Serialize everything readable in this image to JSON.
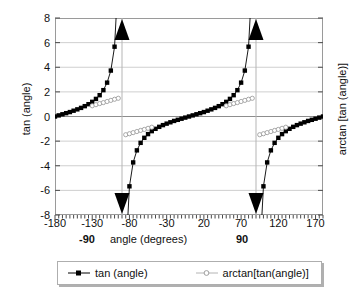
{
  "chart_data": {
    "type": "line",
    "title": "",
    "xlabel": "angle (degrees)",
    "ylabel": "tan (angle)",
    "ylabel_right": "arctan [tan (angle)]",
    "xlim": [
      -180,
      180
    ],
    "ylim": [
      -8,
      8
    ],
    "xticks": [
      -180,
      -130,
      -80,
      -30,
      20,
      70,
      120,
      170
    ],
    "yticks": [
      8,
      6,
      4,
      2,
      0,
      -2,
      -4,
      -6,
      -8
    ],
    "xtick_labels": [
      "-180",
      "-130",
      "-80",
      "-30",
      "20",
      "70",
      "120",
      "170"
    ],
    "ytick_labels": [
      "8",
      "6",
      "4",
      "2",
      "0",
      "-2",
      "-4",
      "-6",
      "-8"
    ],
    "xminor_step": 5,
    "grid": "horizontal-major-plus-asymptote-verticals",
    "legend_position": "below-plot",
    "asymptotes": [
      -90,
      90
    ],
    "annotations": [
      {
        "name": "arrow-up-left",
        "x": -90,
        "y": 8,
        "direction": "up"
      },
      {
        "name": "arrow-down-left",
        "x": -90,
        "y": -8,
        "direction": "down"
      },
      {
        "name": "arrow-up-right",
        "x": 90,
        "y": 8,
        "direction": "up"
      },
      {
        "name": "arrow-down-right",
        "x": 90,
        "y": -8,
        "direction": "down"
      }
    ],
    "special_xticks": [
      {
        "label": "-90",
        "x": -90
      },
      {
        "label": "90",
        "x": 90
      }
    ],
    "series": [
      {
        "name": "tan (angle)",
        "color": "#000000",
        "marker": "filled-square",
        "segments": [
          {
            "x": [
              -180,
              -175,
              -170,
              -165,
              -160,
              -155,
              -150,
              -145,
              -140,
              -135,
              -130,
              -125,
              -120,
              -115,
              -110,
              -105,
              -100,
              -95
            ],
            "y": [
              0.0,
              0.09,
              0.18,
              0.27,
              0.36,
              0.47,
              0.58,
              0.7,
              0.84,
              1.0,
              1.19,
              1.43,
              1.73,
              2.14,
              2.75,
              3.73,
              5.67,
              11.43
            ]
          },
          {
            "x": [
              -85,
              -80,
              -75,
              -70,
              -65,
              -60,
              -55,
              -50,
              -45,
              -40,
              -35,
              -30,
              -25,
              -20,
              -15,
              -10,
              -5,
              0,
              5,
              10,
              15,
              20,
              25,
              30,
              35,
              40,
              45,
              50,
              55,
              60,
              65,
              70,
              75,
              80,
              85
            ],
            "y": [
              -11.43,
              -5.67,
              -3.73,
              -2.75,
              -2.14,
              -1.73,
              -1.43,
              -1.19,
              -1.0,
              -0.84,
              -0.7,
              -0.58,
              -0.47,
              -0.36,
              -0.27,
              -0.18,
              -0.09,
              0.0,
              0.09,
              0.18,
              0.27,
              0.36,
              0.47,
              0.58,
              0.7,
              0.84,
              1.0,
              1.19,
              1.43,
              1.73,
              2.14,
              2.75,
              3.73,
              5.67,
              11.43
            ]
          },
          {
            "x": [
              95,
              100,
              105,
              110,
              115,
              120,
              125,
              130,
              135,
              140,
              145,
              150,
              155,
              160,
              165,
              170,
              175,
              180
            ],
            "y": [
              -11.43,
              -5.67,
              -3.73,
              -2.75,
              -2.14,
              -1.73,
              -1.43,
              -1.19,
              -1.0,
              -0.84,
              -0.7,
              -0.58,
              -0.47,
              -0.36,
              -0.27,
              -0.18,
              -0.09,
              0.0
            ]
          }
        ]
      },
      {
        "name": "arctan[tan(angle)]",
        "color": "#b4b4b4",
        "marker": "open-circle",
        "segments": [
          {
            "x": [
              -130,
              -125,
              -120,
              -115,
              -110,
              -105,
              -100,
              -95
            ],
            "y": [
              0.87,
              0.96,
              1.05,
              1.13,
              1.22,
              1.31,
              1.4,
              1.48
            ]
          },
          {
            "x": [
              -85,
              -80,
              -75,
              -70,
              -65,
              -60,
              -55,
              -50
            ],
            "y": [
              -1.48,
              -1.4,
              -1.31,
              -1.22,
              -1.13,
              -1.05,
              -0.96,
              -0.87
            ]
          },
          {
            "x": [
              50,
              55,
              60,
              65,
              70,
              75,
              80,
              85
            ],
            "y": [
              0.87,
              0.96,
              1.05,
              1.13,
              1.22,
              1.31,
              1.4,
              1.48
            ]
          },
          {
            "x": [
              95,
              100,
              105,
              110,
              115,
              120,
              125,
              130
            ],
            "y": [
              -1.48,
              -1.4,
              -1.31,
              -1.22,
              -1.13,
              -1.05,
              -0.96,
              -0.87
            ]
          }
        ]
      }
    ]
  },
  "legend": {
    "entries": [
      {
        "label": "tan (angle)",
        "marker": "filled-square-marker",
        "color": "#000000"
      },
      {
        "label": "arctan[tan(angle)]",
        "marker": "open-circle-marker",
        "color": "#b4b4b4"
      }
    ]
  }
}
